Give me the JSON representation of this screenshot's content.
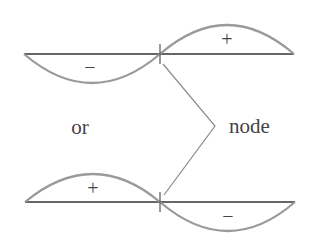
{
  "diagram": {
    "type": "standing-wave-node",
    "colors": {
      "axis": "#333333",
      "curve": "#9a9a9a",
      "leader": "#8a8a8a",
      "text": "#444444"
    },
    "top_wave": {
      "left_lobe_sign": "−",
      "right_lobe_sign": "+"
    },
    "connector_text": "or",
    "node_label": "node",
    "bottom_wave": {
      "left_lobe_sign": "+",
      "right_lobe_sign": "−"
    }
  }
}
